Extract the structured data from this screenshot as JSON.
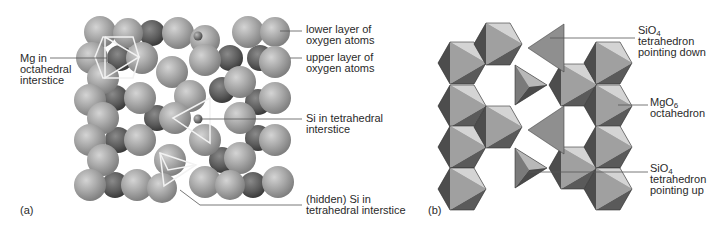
{
  "figure": {
    "panel_a": {
      "tag": "(a)",
      "labels": {
        "mg_octahedral": [
          "Mg in",
          "octahedral",
          "interstice"
        ],
        "lower_layer": [
          "lower layer of",
          "oxygen atoms"
        ],
        "upper_layer": [
          "upper layer of",
          "oxygen atoms"
        ],
        "si_tetrahedral": [
          "Si in tetrahedral",
          "interstice"
        ],
        "hidden_si": [
          "(hidden) Si in",
          "tetrahedral interstice"
        ]
      }
    },
    "panel_b": {
      "tag": "(b)",
      "labels": {
        "sio4_down": {
          "formula": "SiO",
          "subscript": "4",
          "lines": [
            "tetrahedron",
            "pointing down"
          ]
        },
        "mgo6": {
          "formula": "MgO",
          "subscript": "6",
          "lines": [
            "octahedron"
          ]
        },
        "sio4_up": {
          "formula": "SiO",
          "subscript": "4",
          "lines": [
            "tetrahedron",
            "pointing up"
          ]
        }
      }
    },
    "colors": {
      "sphere_light": "#b4b4b4",
      "sphere_mid": "#8c8c8c",
      "sphere_dark": "#4a4a4a",
      "face_light": "#d8d8d8",
      "face_mid": "#a6a6a6",
      "face_dark": "#555555",
      "highlight_lines": "#f2f2f2",
      "leader_lines": "#555555"
    }
  }
}
